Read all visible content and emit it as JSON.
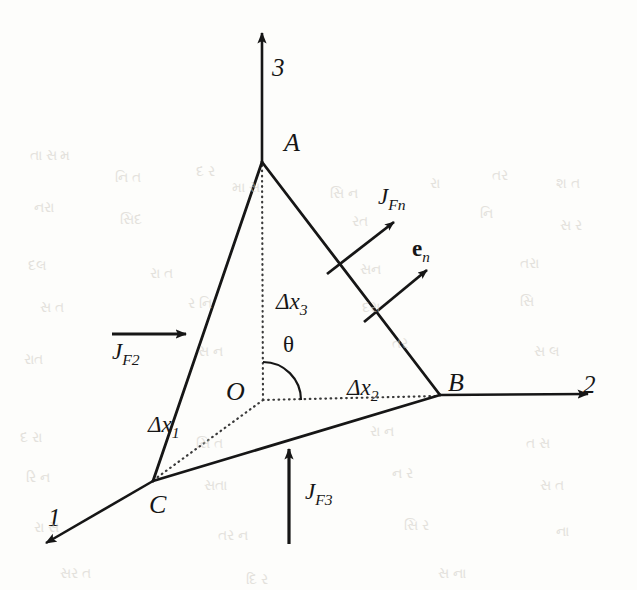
{
  "figure": {
    "background_color": "#fdfdfb",
    "ink_color": "#161616"
  },
  "axes": [
    {
      "name": "axis-1",
      "label": "1",
      "direction": "down-left",
      "label_x": 48,
      "label_y": 505
    },
    {
      "name": "axis-2",
      "label": "2",
      "direction": "right",
      "label_x": 583,
      "label_y": 372
    },
    {
      "name": "axis-3",
      "label": "3",
      "direction": "up",
      "label_x": 272,
      "label_y": 55
    }
  ],
  "vertices": [
    {
      "name": "vertex-a",
      "label": "A",
      "x": 262,
      "y": 162,
      "label_x": 284,
      "label_y": 130
    },
    {
      "name": "vertex-b",
      "label": "B",
      "x": 440,
      "y": 395,
      "label_x": 448,
      "label_y": 370
    },
    {
      "name": "vertex-c",
      "label": "C",
      "x": 153,
      "y": 481,
      "label_x": 149,
      "label_y": 492
    },
    {
      "name": "vertex-o",
      "label": "O",
      "x": 263,
      "y": 400,
      "label_x": 226,
      "label_y": 379
    }
  ],
  "edge_labels": [
    {
      "name": "delta-x1",
      "base": "Δx",
      "sub": "1",
      "label_x": 148,
      "label_y": 413
    },
    {
      "name": "delta-x2",
      "base": "Δx",
      "sub": "2",
      "label_x": 347,
      "label_y": 376
    },
    {
      "name": "delta-x3",
      "base": "Δx",
      "sub": "3",
      "label_x": 276,
      "label_y": 290
    }
  ],
  "angle": {
    "name": "theta-angle",
    "label": "θ",
    "label_x": 283,
    "label_y": 333,
    "center_x": 263,
    "center_y": 400,
    "radius": 38
  },
  "flux_vectors": [
    {
      "name": "flux-jf2",
      "base": "J",
      "sub": "F2",
      "label_x": 112,
      "label_y": 340,
      "arrow": "horizontal-right"
    },
    {
      "name": "flux-jf3",
      "base": "J",
      "sub": "F3",
      "label_x": 305,
      "label_y": 480,
      "arrow": "vertical-up"
    },
    {
      "name": "flux-jfn",
      "base": "J",
      "sub": "Fn",
      "label_x": 378,
      "label_y": 185,
      "arrow": "diagonal-up-right"
    }
  ],
  "normal_vector": {
    "name": "unit-normal-en",
    "base": "e",
    "sub": "n",
    "label_x": 412,
    "label_y": 237,
    "arrow": "diagonal-up-right"
  },
  "ghost_text": [
    {
      "text": "તા સ મ",
      "x": 30,
      "y": 148
    },
    {
      "text": "નિ ત",
      "x": 115,
      "y": 170
    },
    {
      "text": "દ ર",
      "x": 196,
      "y": 164
    },
    {
      "text": "મા સ",
      "x": 232,
      "y": 180
    },
    {
      "text": "સિ ન",
      "x": 330,
      "y": 186
    },
    {
      "text": "રા",
      "x": 430,
      "y": 176
    },
    {
      "text": "તર",
      "x": 492,
      "y": 168
    },
    {
      "text": "શ ત",
      "x": 556,
      "y": 176
    },
    {
      "text": "નરા",
      "x": 34,
      "y": 200
    },
    {
      "text": "સિદ",
      "x": 120,
      "y": 212
    },
    {
      "text": "રત",
      "x": 352,
      "y": 214
    },
    {
      "text": "નિ",
      "x": 480,
      "y": 206
    },
    {
      "text": "સ ર",
      "x": 560,
      "y": 218
    },
    {
      "text": "દલ",
      "x": 28,
      "y": 258
    },
    {
      "text": "રા ત",
      "x": 150,
      "y": 266
    },
    {
      "text": "સન",
      "x": 360,
      "y": 262
    },
    {
      "text": "તરા",
      "x": 520,
      "y": 256
    },
    {
      "text": "સ ત",
      "x": 40,
      "y": 300
    },
    {
      "text": "ર નિ",
      "x": 188,
      "y": 296
    },
    {
      "text": "દરા",
      "x": 362,
      "y": 300
    },
    {
      "text": "સિ",
      "x": 520,
      "y": 294
    },
    {
      "text": "રાત",
      "x": 24,
      "y": 352
    },
    {
      "text": "સ ન",
      "x": 198,
      "y": 344
    },
    {
      "text": "તર",
      "x": 392,
      "y": 336
    },
    {
      "text": "સ લ",
      "x": 534,
      "y": 344
    },
    {
      "text": "દ રા",
      "x": 20,
      "y": 430
    },
    {
      "text": "સિ ત",
      "x": 196,
      "y": 436
    },
    {
      "text": "રા ન",
      "x": 370,
      "y": 424
    },
    {
      "text": "ત સ",
      "x": 526,
      "y": 436
    },
    {
      "text": "રિ ન",
      "x": 26,
      "y": 470
    },
    {
      "text": "સતા",
      "x": 204,
      "y": 478
    },
    {
      "text": "ન ર",
      "x": 392,
      "y": 466
    },
    {
      "text": "સ ત",
      "x": 540,
      "y": 478
    },
    {
      "text": "રા સ",
      "x": 34,
      "y": 520
    },
    {
      "text": "તર ન",
      "x": 218,
      "y": 528
    },
    {
      "text": "સિ ર",
      "x": 404,
      "y": 518
    },
    {
      "text": "ના",
      "x": 556,
      "y": 524
    },
    {
      "text": "સર ત",
      "x": 60,
      "y": 566
    },
    {
      "text": "દિ ર",
      "x": 246,
      "y": 572
    },
    {
      "text": "સ ના",
      "x": 438,
      "y": 566
    }
  ]
}
